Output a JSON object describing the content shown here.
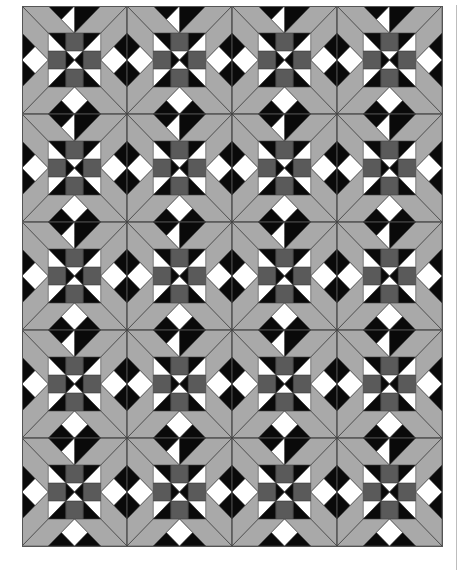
{
  "quilt": {
    "origin": [
      22,
      6
    ],
    "columns": 4,
    "rows": 5,
    "block_width": 105,
    "block_height": 108,
    "colors": {
      "background": "#a9a9a9",
      "dark": "#5a5a5a",
      "black": "#0a0a0a",
      "white": "#ffffff",
      "line": "#444444",
      "border": "#555555"
    },
    "block_pattern": {
      "name": "star-cross nine-patch block",
      "center_nine_patch": {
        "inset_fraction": 0.25,
        "edge_cells": "dark",
        "corner_cells": "black/white half-square triangles, white toward outer corners",
        "middle_cell": "black hourglass left/right, white triangles top/bottom"
      },
      "edge_triangles": "black half-diamond on each side with white inner diamond",
      "corner_lines": "diagonals from block corner to nine-patch corner"
    }
  },
  "side_rule": {
    "color": "#bdbdbd"
  }
}
